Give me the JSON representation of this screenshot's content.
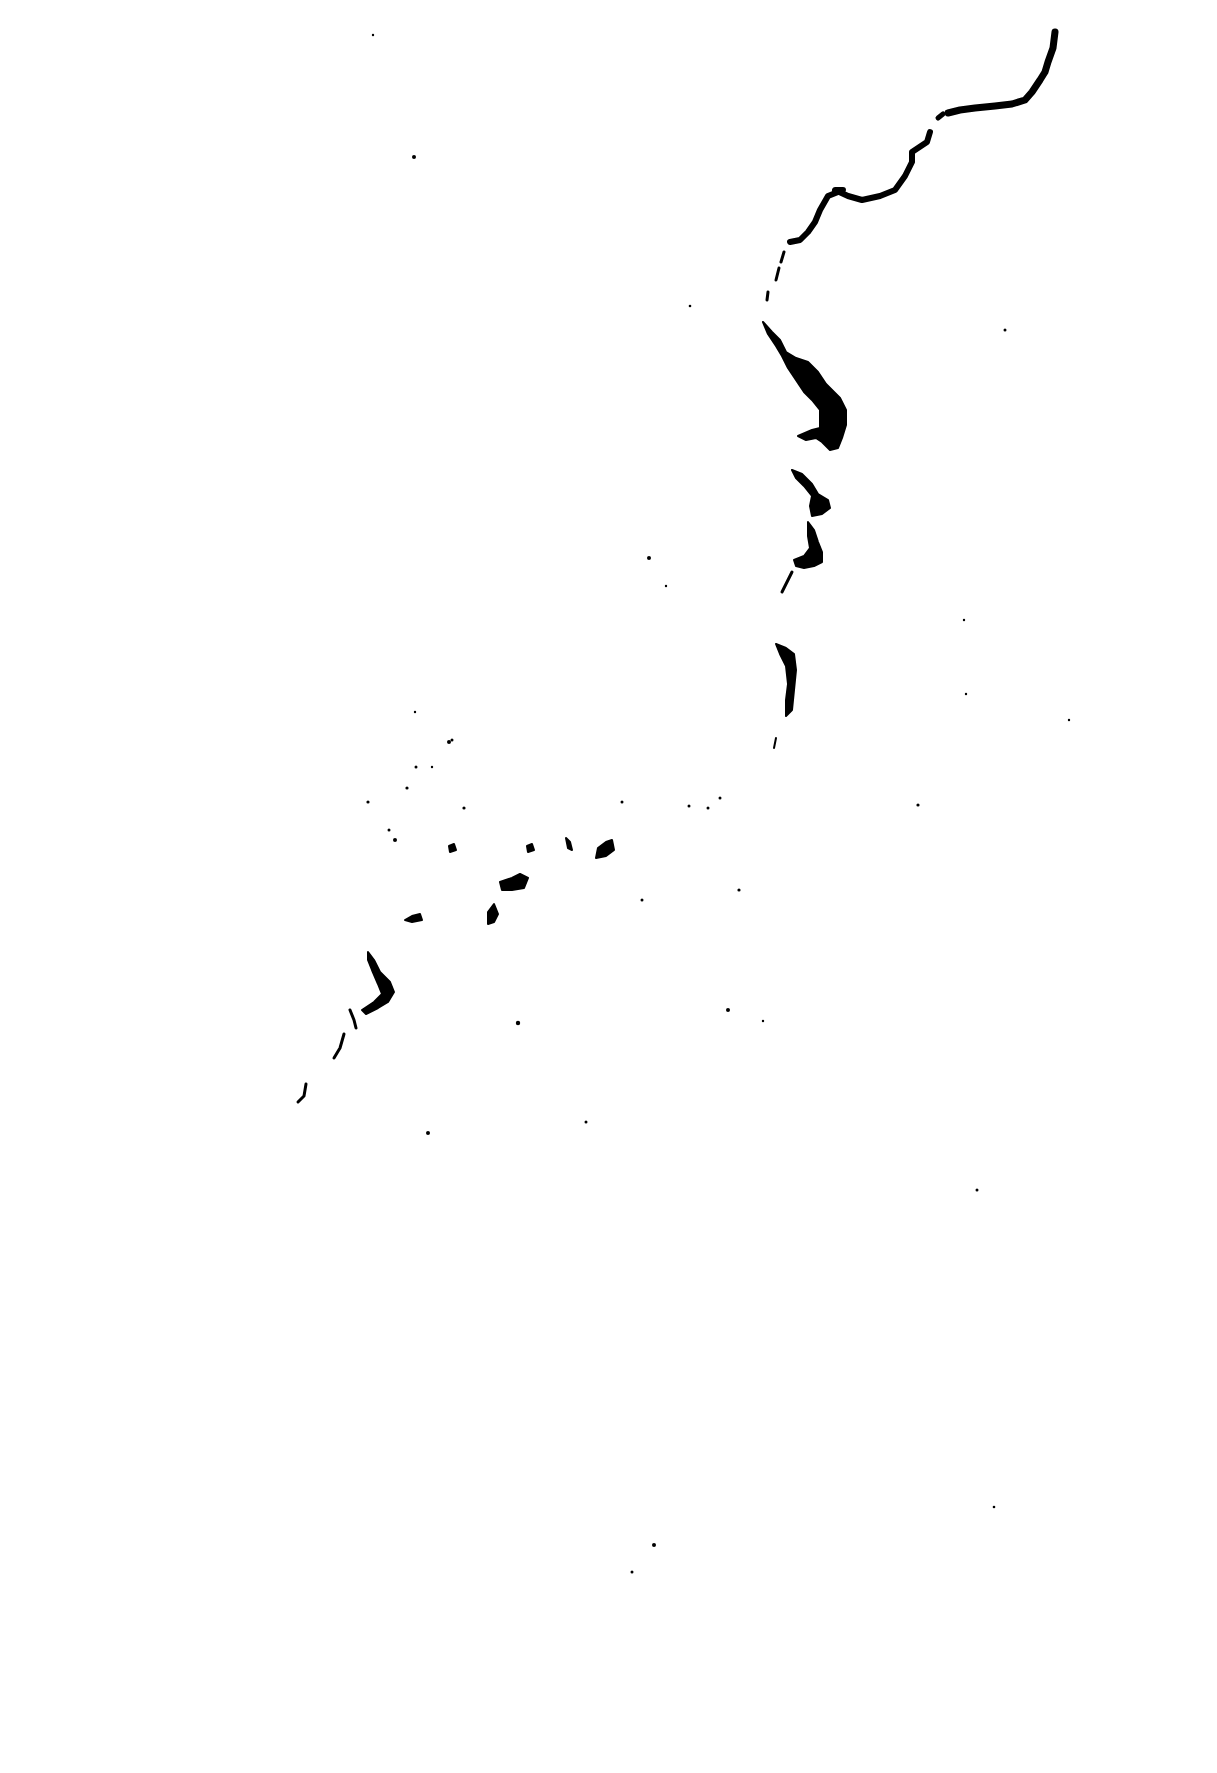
{
  "figure": {
    "kind": "scanned ink silhouette (coastline / archipelago-like)",
    "background_color": "#ffffff",
    "ink_color": "#000000",
    "text": []
  }
}
